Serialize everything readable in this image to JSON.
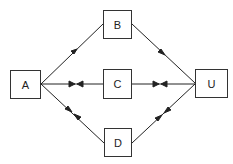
{
  "diagram": {
    "nodes": [
      {
        "id": "A",
        "label": "A"
      },
      {
        "id": "B",
        "label": "B"
      },
      {
        "id": "C",
        "label": "C"
      },
      {
        "id": "D",
        "label": "D"
      },
      {
        "id": "U",
        "label": "U"
      }
    ],
    "edges": [
      {
        "from": "A",
        "to": "B",
        "arrows": "single toward B"
      },
      {
        "from": "B",
        "to": "U",
        "arrows": "single toward U"
      },
      {
        "from": "A",
        "to": "C",
        "arrows": "double opposing"
      },
      {
        "from": "C",
        "to": "U",
        "arrows": "double opposing"
      },
      {
        "from": "A",
        "to": "D",
        "arrows": "double opposing"
      },
      {
        "from": "D",
        "to": "U",
        "arrows": "double opposing"
      }
    ],
    "colors": {
      "line": "#222222",
      "box_border": "#333333",
      "background": "#ffffff"
    }
  }
}
